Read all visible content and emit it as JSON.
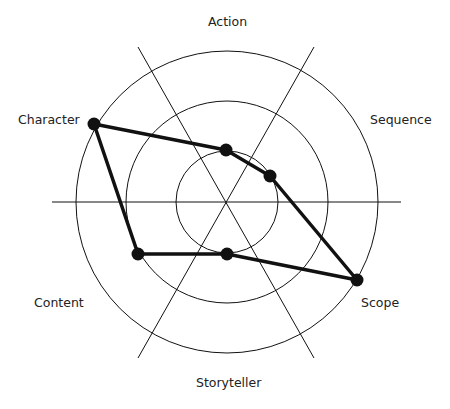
{
  "diagram": {
    "type": "radar",
    "axes": [
      "Action",
      "Sequence",
      "Scope",
      "Storyteller",
      "Content",
      "Character"
    ],
    "rings": 3,
    "points": [
      {
        "axis": "Character",
        "x": 94,
        "y": 124
      },
      {
        "axis": "Action",
        "x": 226,
        "y": 150
      },
      {
        "axis": "Sequence",
        "x": 270,
        "y": 176
      },
      {
        "axis": "Scope",
        "x": 357,
        "y": 280
      },
      {
        "axis": "Storyteller",
        "x": 227,
        "y": 254
      },
      {
        "axis": "Content",
        "x": 138,
        "y": 254
      }
    ]
  },
  "labels": {
    "action": "Action",
    "sequence": "Sequence",
    "scope": "Scope",
    "storyteller": "Storyteller",
    "content": "Content",
    "character": "Character"
  }
}
